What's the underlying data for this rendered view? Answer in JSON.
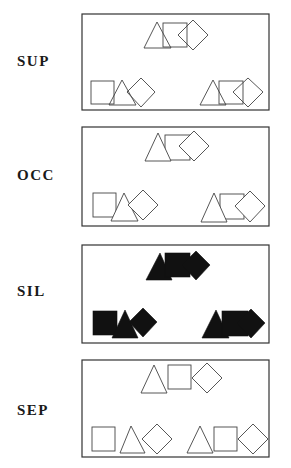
{
  "figure": {
    "conditions": [
      {
        "id": "sup",
        "label": "SUP",
        "style": "superimposed-outline"
      },
      {
        "id": "occ",
        "label": "OCC",
        "style": "occluded-outline"
      },
      {
        "id": "sil",
        "label": "SIL",
        "style": "silhouette-filled"
      },
      {
        "id": "sep",
        "label": "SEP",
        "style": "separated-outline"
      }
    ],
    "shapes_per_group": [
      "triangle",
      "square",
      "diamond"
    ],
    "groups_per_panel": 3,
    "colors": {
      "outline": "#444444",
      "fill_silhouette": "#111111",
      "background": "#ffffff",
      "panel_border": "#333333"
    }
  }
}
